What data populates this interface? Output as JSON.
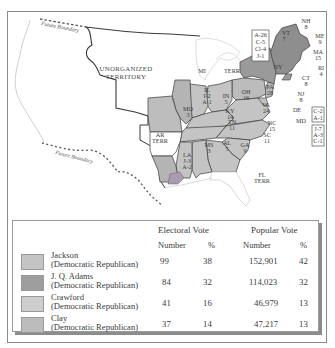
{
  "map": {
    "labels": {
      "future_boundary_north": "Future Boundary",
      "future_boundary_south": "Future Boundary",
      "unorganized_territory_line1": "UNORGANIZED",
      "unorganized_territory_line2": "TERRITORY",
      "mi_terr_1": "MI",
      "mi_terr_2": "TERR",
      "ar_terr_1": "AR",
      "ar_terr_2": "TERR",
      "fl_terr_1": "FL",
      "fl_terr_2": "TERR"
    },
    "states": [
      {
        "abbr": "ME",
        "votes": "9"
      },
      {
        "abbr": "NH",
        "votes": "8"
      },
      {
        "abbr": "VT",
        "votes": "7"
      },
      {
        "abbr": "MA",
        "votes": "15"
      },
      {
        "abbr": "RI",
        "votes": "4"
      },
      {
        "abbr": "CT",
        "votes": "8"
      },
      {
        "abbr": "NY",
        "votes": ""
      },
      {
        "abbr": "NJ",
        "votes": "8"
      },
      {
        "abbr": "DE",
        "votes": ""
      },
      {
        "abbr": "PA",
        "votes": "28"
      },
      {
        "abbr": "OH",
        "votes": "16"
      },
      {
        "abbr": "IN",
        "votes": "5"
      },
      {
        "abbr": "IL",
        "votes": "I-2",
        "votes2": "A-1"
      },
      {
        "abbr": "MO",
        "votes": "3"
      },
      {
        "abbr": "KY",
        "votes": "14"
      },
      {
        "abbr": "VA",
        "votes": "24"
      },
      {
        "abbr": "NC",
        "votes": "15"
      },
      {
        "abbr": "TN",
        "votes": "11"
      },
      {
        "abbr": "SC",
        "votes": "11"
      },
      {
        "abbr": "GA",
        "votes": "9"
      },
      {
        "abbr": "AL",
        "votes": "5"
      },
      {
        "abbr": "MS",
        "votes": "3"
      },
      {
        "abbr": "LA",
        "votes": "J-3",
        "votes2": "A-2"
      },
      {
        "abbr": "MD",
        "votes": ""
      }
    ],
    "split_boxes": {
      "ny": [
        "A-26",
        "C-5",
        "Cl-4",
        "J-1"
      ],
      "de": [
        "C-2",
        "A-1"
      ],
      "md": [
        "J-7",
        "A-3",
        "C-1"
      ]
    },
    "colors": {
      "jackson": "#bcbcbc",
      "adams": "#9a9a9a",
      "crawford": "#c6c6c6",
      "clay": "#b4b4b4",
      "territory": "#ffffff",
      "border": "#3c3c3c",
      "lavender_la": "#a99bb0"
    }
  },
  "legend": {
    "headers": {
      "electoral_vote": "Electoral Vote",
      "popular_vote": "Popular Vote",
      "ev_number": "Number",
      "ev_pct": "%",
      "pv_number": "Number",
      "pv_pct": "%"
    },
    "rows": [
      {
        "name": "Jackson",
        "party": "(Democratic Republican)",
        "ev_number": "99",
        "ev_pct": "38",
        "pv_number": "152,901",
        "pv_pct": "42",
        "color": "#c4c4c4"
      },
      {
        "name": "J. Q. Adams",
        "party": "(Democratic Republican)",
        "ev_number": "84",
        "ev_pct": "32",
        "pv_number": "114,023",
        "pv_pct": "32",
        "color": "#9e9e9e"
      },
      {
        "name": "Crawford",
        "party": "(Democratic Republican)",
        "ev_number": "41",
        "ev_pct": "16",
        "pv_number": "46,979",
        "pv_pct": "13",
        "color": "#cdcdcd"
      },
      {
        "name": "Clay",
        "party": "(Democratic Republican)",
        "ev_number": "37",
        "ev_pct": "14",
        "pv_number": "47,217",
        "pv_pct": "13",
        "color": "#bcbcbc"
      }
    ]
  }
}
